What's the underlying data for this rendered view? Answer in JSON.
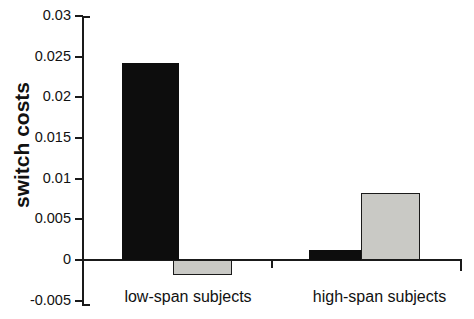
{
  "chart_data": {
    "type": "bar",
    "title": "",
    "xlabel": "",
    "ylabel": "switch costs",
    "categories": [
      "low-span subjects",
      "high-span subjects"
    ],
    "series": [
      {
        "name": "black",
        "color": "#0d0d0d",
        "values": [
          0.0242,
          0.0012
        ]
      },
      {
        "name": "gray",
        "color": "#c9c9c5",
        "values": [
          -0.0019,
          0.0082
        ]
      }
    ],
    "ylim": [
      -0.005,
      0.03
    ],
    "ytick_labels": [
      "0.03",
      "0.025",
      "0.02",
      "0.015",
      "0.01",
      "0.005",
      "0",
      "-0.005"
    ],
    "ytick_values": [
      0.03,
      0.025,
      0.02,
      0.015,
      0.01,
      0.005,
      0,
      -0.005
    ],
    "grid": false,
    "legend": false
  }
}
